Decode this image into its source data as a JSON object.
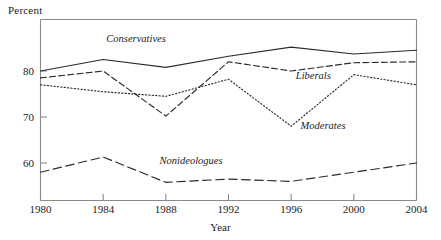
{
  "chart_data": {
    "type": "line",
    "title": "",
    "xlabel": "Year",
    "ylabel": "Percent",
    "categories": [
      "1980",
      "1984",
      "1988",
      "1992",
      "1996",
      "2000",
      "2004"
    ],
    "x": [
      1980,
      1984,
      1988,
      1992,
      1996,
      2000,
      2004
    ],
    "xlim": [
      1980,
      2004
    ],
    "ylim": [
      51,
      88
    ],
    "ytick_labels": [
      "60",
      "70",
      "80"
    ],
    "yticks": [
      60,
      70,
      80
    ],
    "grid": false,
    "legend_position": "inline-annotations",
    "series": [
      {
        "name": "Conservatives",
        "style": "solid",
        "values": [
          80.0,
          82.5,
          80.8,
          83.2,
          85.2,
          83.7,
          84.5
        ]
      },
      {
        "name": "Liberals",
        "style": "dashed",
        "values": [
          78.5,
          80.0,
          70.2,
          82.0,
          80.0,
          81.8,
          82.0
        ]
      },
      {
        "name": "Moderates",
        "style": "dotted",
        "values": [
          77.0,
          75.5,
          74.5,
          78.2,
          68.0,
          79.2,
          77.0
        ]
      },
      {
        "name": "Nonideologues",
        "style": "long-dashed",
        "values": [
          58.0,
          61.3,
          55.8,
          56.5,
          56.0,
          58.0,
          60.0
        ]
      }
    ],
    "annotations": [
      {
        "text": "Conservatives",
        "x": 1984.2,
        "y": 86.3
      },
      {
        "text": "Liberals",
        "x": 1996.3,
        "y": 78.2
      },
      {
        "text": "Moderates",
        "x": 1996.6,
        "y": 67.4
      },
      {
        "text": "Nonideologues",
        "x": 1987.6,
        "y": 59.7
      }
    ]
  },
  "axes": {
    "y_title": "Percent",
    "x_title": "Year"
  }
}
